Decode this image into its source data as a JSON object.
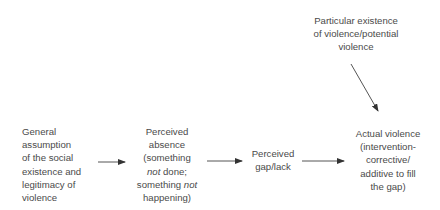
{
  "diagram": {
    "type": "flow",
    "nodes": [
      {
        "id": "general",
        "lines": [
          "General",
          "assumption",
          "of the social",
          "existence and",
          "legitimacy of",
          "violence"
        ]
      },
      {
        "id": "absence",
        "lines": [
          "Perceived",
          "absence",
          "(something",
          "not done;",
          "something not",
          "happening)"
        ]
      },
      {
        "id": "gap",
        "lines": [
          "Perceived",
          "gap/lack"
        ]
      },
      {
        "id": "actual",
        "lines": [
          "Actual violence",
          "(intervention-",
          "corrective/",
          "additive to fill",
          "the gap)"
        ]
      },
      {
        "id": "particular",
        "lines": [
          "Particular existence",
          "of violence/potential",
          "violence"
        ]
      }
    ],
    "absence_italic": {
      "line4_italic": "not",
      "line4_rest": " done;",
      "line5_pre": "something ",
      "line5_italic": "not"
    },
    "edges": [
      {
        "from": "general",
        "to": "absence"
      },
      {
        "from": "absence",
        "to": "gap"
      },
      {
        "from": "gap",
        "to": "actual"
      },
      {
        "from": "particular",
        "to": "actual"
      }
    ],
    "colors": {
      "text": "#4a4a4a",
      "arrow": "#333333",
      "background": "#ffffff"
    }
  }
}
